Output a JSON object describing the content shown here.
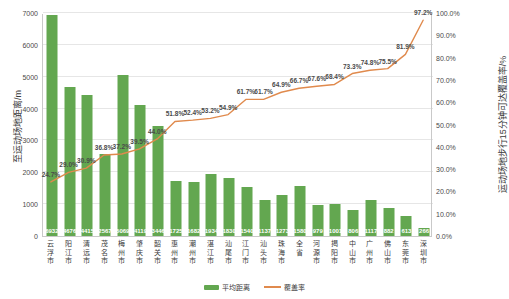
{
  "chart_data": {
    "type": "bar",
    "title": "",
    "xlabel": "",
    "ylabel": "至运动场地距离/m",
    "y2label": "运动场地步行15分钟可达覆盖率/%",
    "ylim": [
      0,
      7000
    ],
    "y2lim": [
      0,
      1.0
    ],
    "grid": true,
    "legend_position": "bottom-center",
    "categories": [
      "云浮市",
      "阳江市",
      "清远市",
      "茂名市",
      "梅州市",
      "肇庆市",
      "韶关市",
      "惠州市",
      "潮州市",
      "湛江市",
      "汕尾市",
      "江门市",
      "汕头市",
      "珠海市",
      "全省",
      "河源市",
      "揭阳市",
      "中山市",
      "广州市",
      "佛山市",
      "东莞市",
      "深圳市"
    ],
    "yticks": [
      "0",
      "1000",
      "2000",
      "3000",
      "4000",
      "5000",
      "6000",
      "7000"
    ],
    "y2ticks": [
      "0.0%",
      "10.0%",
      "20.0%",
      "30.0%",
      "40.0%",
      "50.0%",
      "60.0%",
      "70.0%",
      "80.0%",
      "90.0%",
      "100.0%"
    ],
    "series": [
      {
        "name": "平均距离",
        "type": "bar",
        "axis": "left",
        "color": "#63a750",
        "values": [
          6932,
          4676,
          4415,
          2567,
          5069,
          4119,
          3446,
          1725,
          1682,
          1934,
          1830,
          1540,
          1137,
          1273,
          1580,
          979,
          1001,
          806,
          1117,
          882,
          613,
          266
        ],
        "value_labels": [
          "6932",
          "4676",
          "4415",
          "2567",
          "5069",
          "4119",
          "3446",
          "1725",
          "1682",
          "1934",
          "1830",
          "1540",
          "1137",
          "1273",
          "1580",
          "979",
          "1001",
          "806",
          "1117",
          "882",
          "613",
          "266"
        ]
      },
      {
        "name": "覆盖率",
        "type": "line",
        "axis": "right",
        "color": "#e08a4d",
        "values": [
          0.247,
          0.29,
          0.309,
          0.368,
          0.372,
          0.395,
          0.44,
          0.518,
          0.524,
          0.532,
          0.549,
          0.617,
          0.617,
          0.649,
          0.667,
          0.676,
          0.684,
          0.733,
          0.748,
          0.755,
          0.819,
          0.972
        ],
        "value_labels": [
          "24.7%",
          "29.0%",
          "30.9%",
          "36.8%",
          "37.2%",
          "39.5%",
          "44.0%",
          "51.8%",
          "52.4%",
          "53.2%",
          "54.9%",
          "61.7%",
          "61.7%",
          "64.9%",
          "66.7%",
          "67.6%",
          "68.4%",
          "73.3%",
          "74.8%",
          "75.5%",
          "81.9%",
          "97.2%"
        ]
      }
    ]
  },
  "legend": {
    "items": [
      {
        "label": "平均距离",
        "marker": "bar-swatch",
        "color": "#63a750"
      },
      {
        "label": "覆盖率",
        "marker": "line-swatch",
        "color": "#e08a4d"
      }
    ]
  },
  "colors": {
    "bar": "#63a750",
    "line": "#e08a4d",
    "grid": "#e6e6e6",
    "axis": "#c9c9c9",
    "text": "#3b3b3b",
    "background": "#ffffff"
  }
}
